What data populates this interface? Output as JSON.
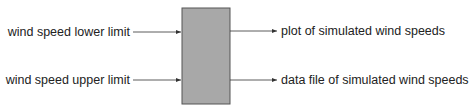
{
  "diagram": {
    "type": "block-diagram",
    "process_box": {
      "label": "",
      "fill": "#a8a8a8",
      "stroke": "#555555"
    },
    "inputs": [
      {
        "label": "wind speed lower limit"
      },
      {
        "label": "wind speed upper limit"
      }
    ],
    "outputs": [
      {
        "label": "plot of simulated wind speeds"
      },
      {
        "label": "data file of simulated wind speeds"
      }
    ],
    "colors": {
      "line": "#333333",
      "text": "#222222",
      "box_fill": "#a8a8a8"
    }
  }
}
